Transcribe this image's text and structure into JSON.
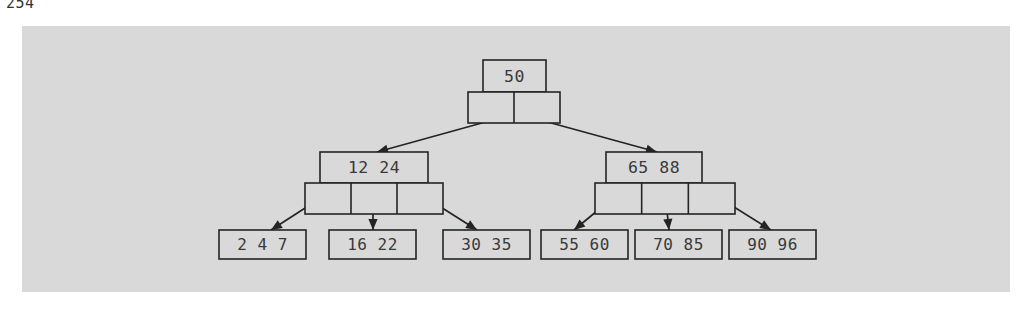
{
  "page": {
    "caption": "254",
    "background_color": "#ffffff"
  },
  "figure": {
    "name": "b-tree-diagram",
    "panel_color": "#d9d9d9",
    "stroke_color": "#242424",
    "text_color": "#3a3a3a",
    "panel": {
      "x": 22,
      "y": 26,
      "width": 988,
      "height": 266
    }
  },
  "chart_data": {
    "type": "diagram",
    "diagram_type": "b-tree",
    "title": "",
    "order": 3,
    "levels": 3,
    "nodes": [
      {
        "id": "root",
        "level": 0,
        "keys": [
          "50"
        ],
        "key_text": "50",
        "pointer_cells": 2,
        "key_box": {
          "x": 483,
          "y": 60,
          "width": 63,
          "height": 32
        },
        "pointer_box": {
          "x": 468,
          "y": 92,
          "width": 92,
          "height": 31
        }
      },
      {
        "id": "internal-left",
        "level": 1,
        "keys": [
          "12",
          "24"
        ],
        "key_text": "12  24",
        "pointer_cells": 3,
        "key_box": {
          "x": 320,
          "y": 152,
          "width": 108,
          "height": 31
        },
        "pointer_box": {
          "x": 305,
          "y": 183,
          "width": 138,
          "height": 31
        }
      },
      {
        "id": "internal-right",
        "level": 1,
        "keys": [
          "65",
          "88"
        ],
        "key_text": "65  88",
        "pointer_cells": 3,
        "key_box": {
          "x": 606,
          "y": 152,
          "width": 96,
          "height": 31
        },
        "pointer_box": {
          "x": 595,
          "y": 183,
          "width": 140,
          "height": 31
        }
      },
      {
        "id": "leaf-1",
        "level": 2,
        "keys": [
          "2",
          "4",
          "7"
        ],
        "key_text": "2  4  7",
        "key_box": {
          "x": 219,
          "y": 230,
          "width": 87,
          "height": 29
        }
      },
      {
        "id": "leaf-2",
        "level": 2,
        "keys": [
          "16",
          "22"
        ],
        "key_text": "16 22",
        "key_box": {
          "x": 329,
          "y": 230,
          "width": 87,
          "height": 29
        }
      },
      {
        "id": "leaf-3",
        "level": 2,
        "keys": [
          "30",
          "35"
        ],
        "key_text": "30 35",
        "key_box": {
          "x": 443,
          "y": 230,
          "width": 87,
          "height": 29
        }
      },
      {
        "id": "leaf-4",
        "level": 2,
        "keys": [
          "55",
          "60"
        ],
        "key_text": "55 60",
        "key_box": {
          "x": 541,
          "y": 230,
          "width": 87,
          "height": 29
        }
      },
      {
        "id": "leaf-5",
        "level": 2,
        "keys": [
          "70",
          "85"
        ],
        "key_text": "70 85",
        "key_box": {
          "x": 635,
          "y": 230,
          "width": 87,
          "height": 29
        }
      },
      {
        "id": "leaf-6",
        "level": 2,
        "keys": [
          "90",
          "96"
        ],
        "key_text": "90 96",
        "key_box": {
          "x": 729,
          "y": 230,
          "width": 87,
          "height": 29
        }
      }
    ],
    "edges": [
      {
        "id": "root-to-internal-left",
        "from": "root",
        "to": "internal-left",
        "x1": 500,
        "y1": 118,
        "x2": 377,
        "y2": 152
      },
      {
        "id": "root-to-internal-right",
        "from": "root",
        "to": "internal-right",
        "x1": 533,
        "y1": 118,
        "x2": 657,
        "y2": 152
      },
      {
        "id": "internal-left-to-leaf-1",
        "from": "internal-left",
        "to": "leaf-1",
        "x1": 330,
        "y1": 192,
        "x2": 271,
        "y2": 230
      },
      {
        "id": "internal-left-to-leaf-2",
        "from": "internal-left",
        "to": "leaf-2",
        "x1": 373,
        "y1": 192,
        "x2": 373,
        "y2": 230
      },
      {
        "id": "internal-left-to-leaf-3",
        "from": "internal-left",
        "to": "leaf-3",
        "x1": 417,
        "y1": 192,
        "x2": 477,
        "y2": 230
      },
      {
        "id": "internal-right-to-leaf-4",
        "from": "internal-right",
        "to": "leaf-4",
        "x1": 620,
        "y1": 192,
        "x2": 574,
        "y2": 230
      },
      {
        "id": "internal-right-to-leaf-5",
        "from": "internal-right",
        "to": "leaf-5",
        "x1": 665,
        "y1": 192,
        "x2": 669,
        "y2": 230
      },
      {
        "id": "internal-right-to-leaf-6",
        "from": "internal-right",
        "to": "leaf-6",
        "x1": 710,
        "y1": 192,
        "x2": 771,
        "y2": 230
      }
    ]
  }
}
